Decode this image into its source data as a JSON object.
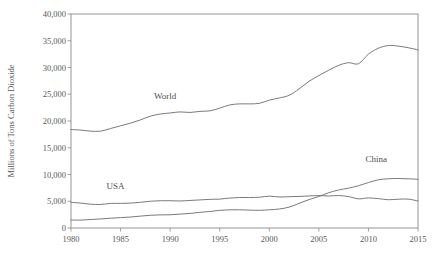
{
  "chart_data": {
    "type": "line",
    "title": "",
    "xlabel": "",
    "ylabel": "Millions of Tons Carbon Dioxide",
    "xlim": [
      1980,
      2015
    ],
    "ylim": [
      0,
      40000
    ],
    "grid": false,
    "legend_position": "inline-annotations",
    "xticks": [
      "1980",
      "1985",
      "1990",
      "1995",
      "2000",
      "2005",
      "2010",
      "2015"
    ],
    "xtick_values": [
      1980,
      1985,
      1990,
      1995,
      2000,
      2005,
      2010,
      2015
    ],
    "yticks": [
      "0",
      "5,000",
      "10,000",
      "15,000",
      "20,000",
      "25,000",
      "30,000",
      "35,000",
      "40,000"
    ],
    "ytick_values": [
      0,
      5000,
      10000,
      15000,
      20000,
      25000,
      30000,
      35000,
      40000
    ],
    "x": [
      1980,
      1981,
      1982,
      1983,
      1984,
      1985,
      1986,
      1987,
      1988,
      1989,
      1990,
      1991,
      1992,
      1993,
      1994,
      1995,
      1996,
      1997,
      1998,
      1999,
      2000,
      2001,
      2002,
      2003,
      2004,
      2005,
      2006,
      2007,
      2008,
      2009,
      2010,
      2011,
      2012,
      2013,
      2014,
      2015
    ],
    "series": [
      {
        "name": "World",
        "label": "World",
        "color": "#6b6b6b",
        "values": [
          18400,
          18300,
          18100,
          18100,
          18600,
          19100,
          19600,
          20200,
          20900,
          21300,
          21500,
          21700,
          21600,
          21800,
          21900,
          22400,
          23000,
          23200,
          23200,
          23300,
          23900,
          24300,
          24800,
          26000,
          27400,
          28500,
          29500,
          30400,
          30900,
          30700,
          32500,
          33600,
          34100,
          34000,
          33700,
          33300
        ]
      },
      {
        "name": "USA",
        "label": "USA",
        "color": "#6b6b6b",
        "values": [
          4800,
          4650,
          4450,
          4400,
          4600,
          4600,
          4650,
          4800,
          5000,
          5100,
          5100,
          5050,
          5150,
          5250,
          5350,
          5400,
          5600,
          5700,
          5700,
          5750,
          5950,
          5800,
          5850,
          5900,
          5990,
          6060,
          5980,
          6070,
          5870,
          5450,
          5620,
          5490,
          5280,
          5380,
          5400,
          5050
        ]
      },
      {
        "name": "China",
        "label": "China",
        "color": "#6b6b6b",
        "values": [
          1490,
          1480,
          1590,
          1700,
          1830,
          1940,
          2050,
          2220,
          2380,
          2450,
          2470,
          2600,
          2720,
          2930,
          3080,
          3300,
          3400,
          3400,
          3350,
          3300,
          3400,
          3550,
          3900,
          4600,
          5300,
          5900,
          6600,
          7100,
          7450,
          7900,
          8500,
          9000,
          9200,
          9250,
          9200,
          9100
        ]
      }
    ],
    "annotations": [
      {
        "text": "World",
        "x": 1989.5,
        "y": 24200
      },
      {
        "text": "USA",
        "x": 1984.5,
        "y": 7200
      },
      {
        "text": "China",
        "x": 2010.8,
        "y": 12300
      }
    ]
  }
}
